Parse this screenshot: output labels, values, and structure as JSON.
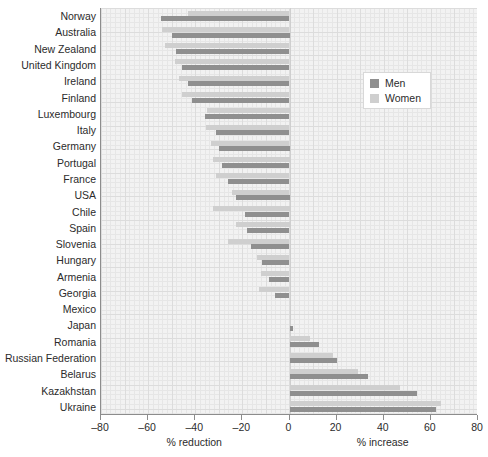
{
  "chart_data": {
    "type": "bar",
    "orientation": "horizontal",
    "title": "",
    "subtitle": "",
    "xlabel_left": "% reduction",
    "xlabel_right": "% increase",
    "ylabel": "",
    "xlim": [
      -80,
      80
    ],
    "xticks": [
      -80,
      -60,
      -40,
      -20,
      0,
      20,
      40,
      60,
      80
    ],
    "xticklabels": [
      "–80",
      "–60",
      "–40",
      "–20",
      "0",
      "20",
      "40",
      "60",
      "80"
    ],
    "grid": true,
    "legend_position": "upper right",
    "categories": [
      "Norway",
      "Australia",
      "New Zealand",
      "United Kingdom",
      "Ireland",
      "Finland",
      "Luxembourg",
      "Italy",
      "Germany",
      "Portugal",
      "France",
      "USA",
      "Chile",
      "Spain",
      "Slovenia",
      "Hungary",
      "Armenia",
      "Georgia",
      "Mexico",
      "Japan",
      "Romania",
      "Russian Federation",
      "Belarus",
      "Kazakhstan",
      "Ukraine"
    ],
    "series": [
      {
        "name": "Men",
        "color": "#8f8f8f",
        "values": [
          -54.5,
          -50.0,
          -48.0,
          -45.5,
          -43.0,
          -41.5,
          -36.0,
          -31.0,
          -30.0,
          -28.5,
          -26.0,
          -22.5,
          -19.0,
          -18.0,
          -16.5,
          -11.5,
          -8.5,
          -6.0,
          0.0,
          1.5,
          12.5,
          20.0,
          33.5,
          54.0,
          62.0
        ]
      },
      {
        "name": "Women",
        "color": "#cfcfcf",
        "values": [
          -43.0,
          -54.0,
          -53.0,
          -48.5,
          -47.0,
          -45.5,
          -35.0,
          -35.5,
          -33.5,
          -32.5,
          -31.0,
          -24.5,
          -32.5,
          -22.5,
          -26.0,
          -14.0,
          -12.0,
          -13.0,
          0.0,
          0.5,
          8.5,
          18.5,
          29.0,
          47.0,
          64.5
        ]
      }
    ]
  },
  "legend": {
    "items": [
      {
        "label": "Men",
        "color": "#8f8f8f"
      },
      {
        "label": "Women",
        "color": "#cfcfcf"
      }
    ]
  }
}
